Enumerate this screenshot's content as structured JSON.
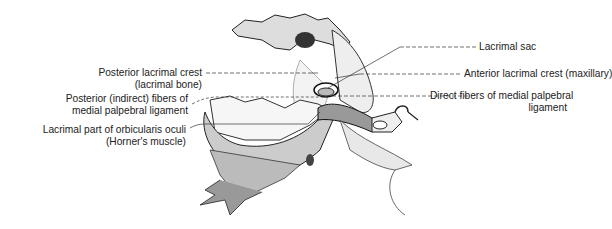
{
  "figure": {
    "labels_left": [
      {
        "id": "posterior-lacrimal-crest",
        "lines": [
          "Posterior lacrimal crest",
          "(lacrimal bone)"
        ]
      },
      {
        "id": "posterior-fibers",
        "lines": [
          "Posterior (indirect) fibers of",
          "medial palpebral ligament"
        ]
      },
      {
        "id": "lacrimal-part-orbicularis",
        "lines": [
          "Lacrimal part of orbicularis oculi",
          "(Horner's muscle)"
        ]
      }
    ],
    "labels_right": [
      {
        "id": "lacrimal-sac",
        "lines": [
          "Lacrimal sac"
        ]
      },
      {
        "id": "anterior-lacrimal-crest",
        "lines": [
          "Anterior lacrimal crest (maxillary)"
        ]
      },
      {
        "id": "direct-fibers",
        "lines": [
          "Direct fibers of medial palpebral",
          "ligament"
        ]
      }
    ]
  }
}
